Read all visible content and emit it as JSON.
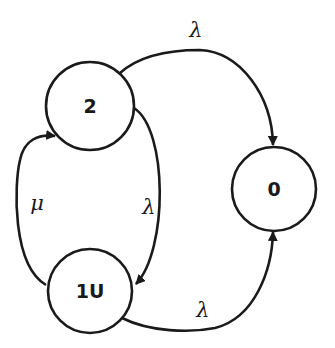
{
  "diagram": {
    "type": "state-transition",
    "colors": {
      "stroke": "#1a1a1a",
      "background": "#ffffff"
    },
    "nodes": [
      {
        "id": "2",
        "label": "2",
        "cx": 90,
        "cy": 106,
        "r": 44
      },
      {
        "id": "1U",
        "label": "1U",
        "cx": 90,
        "cy": 291,
        "r": 42
      },
      {
        "id": "0",
        "label": "0",
        "cx": 274,
        "cy": 189,
        "r": 42
      }
    ],
    "edges": [
      {
        "from": "2",
        "to": "0",
        "label": "λ"
      },
      {
        "from": "2",
        "to": "1U",
        "label": "λ"
      },
      {
        "from": "1U",
        "to": "2",
        "label": "μ"
      },
      {
        "from": "1U",
        "to": "0",
        "label": "λ"
      }
    ]
  }
}
